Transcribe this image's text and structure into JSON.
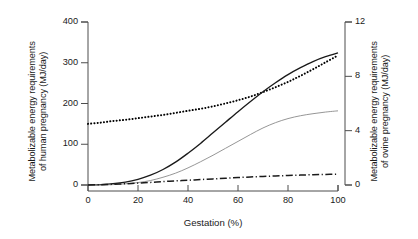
{
  "chart_data": {
    "type": "line",
    "title": "",
    "xlabel": "Gestation (%)",
    "ylabel_left": "Metabolizable energy requirements of human pregnancy (MJ/day)",
    "ylabel_left_line1": "Metabolizable energy requirements",
    "ylabel_left_line2": "of human pregnancy (MJ/day)",
    "ylabel_right": "Metabolizable energy requirements of ovine pregnancy (MJ/day)",
    "ylabel_right_line1": "Metabolizable energy requirements",
    "ylabel_right_line2": "of ovine pregnancy (MJ/day)",
    "xlim": [
      0,
      100
    ],
    "ylim_left": [
      0,
      400
    ],
    "ylim_right": [
      0,
      12
    ],
    "xticks": [
      0,
      20,
      40,
      60,
      80,
      100
    ],
    "yticks_left": [
      0,
      100,
      200,
      300,
      400
    ],
    "yticks_right": [
      0,
      4,
      8,
      12
    ],
    "xtick_labels": [
      "0",
      "20",
      "40",
      "60",
      "80",
      "100"
    ],
    "ytick_labels_left": [
      "0",
      "100",
      "200",
      "300",
      "400"
    ],
    "ytick_labels_right": [
      "0",
      "4",
      "8",
      "12"
    ],
    "grid": false,
    "legend": "none",
    "x": [
      0,
      5,
      10,
      15,
      20,
      25,
      30,
      35,
      40,
      45,
      50,
      55,
      60,
      65,
      70,
      75,
      80,
      85,
      90,
      95,
      100
    ],
    "series": [
      {
        "name": "dotted-rising-series",
        "style": "dotted",
        "color": "#000000",
        "axis": "left",
        "values": [
          150,
          153,
          157,
          160,
          164,
          168,
          172,
          177,
          182,
          187,
          193,
          200,
          208,
          217,
          228,
          240,
          253,
          268,
          284,
          301,
          318
        ]
      },
      {
        "name": "solid-black-sigmoid-series",
        "style": "solid",
        "color": "#1a1a1a",
        "axis": "left",
        "values": [
          0,
          1,
          3,
          7,
          14,
          24,
          38,
          56,
          78,
          102,
          128,
          154,
          180,
          205,
          229,
          251,
          271,
          288,
          303,
          315,
          324
        ]
      },
      {
        "name": "thin-grey-sigmoid-series",
        "style": "solid-thin",
        "color": "#8a8a8a",
        "axis": "left",
        "values": [
          0,
          0,
          1,
          3,
          6,
          11,
          19,
          29,
          42,
          57,
          73,
          90,
          107,
          124,
          140,
          153,
          163,
          170,
          175,
          179,
          182
        ]
      },
      {
        "name": "dash-dot-series",
        "style": "dashdot",
        "color": "#1a1a1a",
        "axis": "right",
        "values": [
          0.0,
          0.02,
          0.05,
          0.09,
          0.14,
          0.19,
          0.25,
          0.3,
          0.35,
          0.4,
          0.45,
          0.5,
          0.55,
          0.59,
          0.63,
          0.67,
          0.7,
          0.73,
          0.76,
          0.78,
          0.8
        ]
      }
    ],
    "colors": {
      "axis": "#4d4d4d",
      "text": "#1a1a1a",
      "grey_series": "#8a8a8a",
      "background": "#ffffff"
    }
  }
}
